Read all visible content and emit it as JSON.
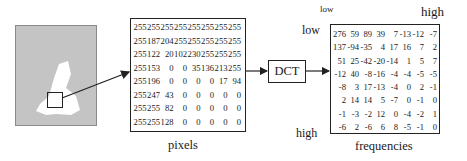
{
  "diagram": {
    "source_image": {
      "description": "gray image with white shape, small square region selected"
    },
    "pixels": {
      "caption": "pixels",
      "rows": [
        [
          "255",
          "255",
          "255",
          "255",
          "255",
          "255",
          "255",
          "255"
        ],
        [
          "255",
          "187",
          "204",
          "255",
          "255",
          "255",
          "255",
          "255"
        ],
        [
          "255",
          "122",
          "20",
          "102",
          "230",
          "255",
          "255",
          "255"
        ],
        [
          "255",
          "153",
          "0",
          "0",
          "35",
          "136",
          "213",
          "255"
        ],
        [
          "255",
          "196",
          "0",
          "0",
          "0",
          "0",
          "17",
          "94"
        ],
        [
          "255",
          "247",
          "43",
          "0",
          "0",
          "0",
          "0",
          "0"
        ],
        [
          "255",
          "255",
          "82",
          "0",
          "0",
          "0",
          "0",
          "0"
        ],
        [
          "255",
          "255",
          "128",
          "0",
          "0",
          "0",
          "0",
          "0"
        ]
      ]
    },
    "transform": {
      "label": "DCT"
    },
    "frequencies": {
      "caption": "frequencies",
      "axis_top_low": "low",
      "axis_top_high": "high",
      "axis_left_low": "low",
      "axis_left_high": "high",
      "rows": [
        [
          "276",
          "59",
          "89",
          "39",
          "7",
          "-13",
          "-12",
          "-7"
        ],
        [
          "137",
          "-94",
          "-35",
          "4",
          "17",
          "16",
          "7",
          "2"
        ],
        [
          "51",
          "25",
          "-42",
          "-20",
          "-14",
          "1",
          "5",
          "7"
        ],
        [
          "-12",
          "40",
          "-8",
          "-16",
          "-4",
          "-4",
          "-5",
          "-5"
        ],
        [
          "-8",
          "3",
          "17",
          "-13",
          "-4",
          "0",
          "2",
          "-1"
        ],
        [
          "2",
          "14",
          "14",
          "5",
          "-7",
          "0",
          "-1",
          "0"
        ],
        [
          "-1",
          "-3",
          "-2",
          "12",
          "0",
          "-4",
          "-2",
          "1"
        ],
        [
          "-6",
          "2",
          "-6",
          "6",
          "8",
          "-5",
          "-1",
          "0"
        ]
      ]
    }
  }
}
